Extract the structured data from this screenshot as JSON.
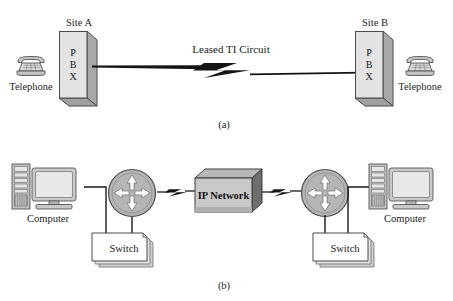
{
  "figure": {
    "background": "#ffffff",
    "captions": {
      "a": "(a)",
      "b": "(b)"
    }
  },
  "colors": {
    "box_face": "#e3e3e3",
    "box_shade": "#a8a8a8",
    "box_shade_dark": "#8f8f8f",
    "outline": "#4a4a4a",
    "line": "#1a1a1a",
    "router_fill": "#b5b5b5",
    "arrow_fill": "#ffffff",
    "ipnet_face": "#c9c9c9",
    "ipnet_side": "#6e6e6e",
    "switch_face": "#fdfdfd",
    "shadow": "#bdbdbd"
  },
  "panel_a": {
    "caption": "(a)",
    "site_left": {
      "site_label": "Site A",
      "device_label": "PBX",
      "device_letters": [
        "P",
        "B",
        "X"
      ],
      "endpoint_label": "Telephone",
      "endpoint_icon": "telephone-icon"
    },
    "link": {
      "label": "Leased TI Circuit",
      "icon": "lightning-bolt-icon",
      "style": "leased-line"
    },
    "site_right": {
      "site_label": "Site B",
      "device_label": "PBX",
      "device_letters": [
        "P",
        "B",
        "X"
      ],
      "endpoint_label": "Telephone",
      "endpoint_icon": "telephone-icon"
    }
  },
  "panel_b": {
    "caption": "(b)",
    "side_left": {
      "computer_label": "Computer",
      "computer_icon": "desktop-computer-icon",
      "switch_label": "Switch",
      "switch_icon": "switch-box-icon",
      "router_icon": "router-icon"
    },
    "cloud": {
      "label": "IP Network",
      "icon": "network-box-icon"
    },
    "side_right": {
      "computer_label": "Computer",
      "computer_icon": "desktop-computer-icon",
      "switch_label": "Switch",
      "switch_icon": "switch-box-icon",
      "router_icon": "router-icon"
    },
    "links": {
      "icon": "lightning-bolt-icon"
    }
  }
}
